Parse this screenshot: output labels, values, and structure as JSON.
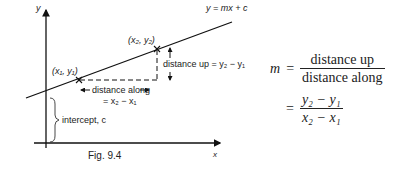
{
  "figure": {
    "caption": "Fig. 9.4",
    "axes": {
      "y_label": "y",
      "x_label": "x"
    },
    "line_label": "y = mx + c",
    "points": [
      {
        "name": "point-1",
        "label": "(x₁, y₁)"
      },
      {
        "name": "point-2",
        "label": "(x₂, y₂)"
      }
    ],
    "annotations": {
      "distance_up": "distance up = y₂ − y₁",
      "distance_along_line1": "distance along",
      "distance_along_line2": "= x₂ − x₁",
      "intercept": "intercept, c"
    }
  },
  "formula": {
    "lhs": "m",
    "eq": "=",
    "frac1_num": "distance up",
    "frac1_den": "distance along",
    "frac2_num": "y₂ − y₁",
    "frac2_den": "x₂ − x₁"
  }
}
